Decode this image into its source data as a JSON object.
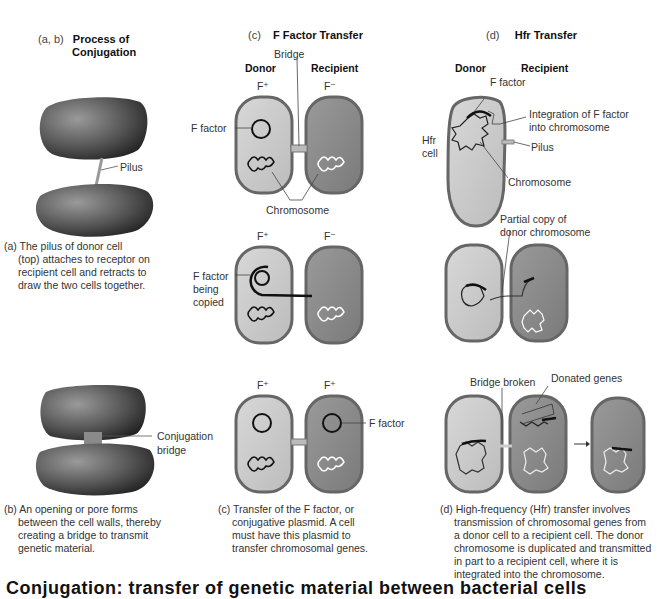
{
  "columns": {
    "ab": {
      "prefix": "(a, b)",
      "title_line1": "Process of",
      "title_line2": "Conjugation"
    },
    "c": {
      "prefix": "(c)",
      "title": "F Factor Transfer"
    },
    "d": {
      "prefix": "(d)",
      "title": "Hfr Transfer"
    }
  },
  "panel_a": {
    "pilus_label": "Pilus",
    "caption_lines": [
      "(a) The pilus of donor cell",
      "(top) attaches to receptor on",
      "recipient cell and retracts to",
      "draw the two cells together."
    ]
  },
  "panel_b": {
    "bridge_label_1": "Conjugation",
    "bridge_label_2": "bridge",
    "caption_lines": [
      "(b) An opening or pore forms",
      "between the cell walls, thereby",
      "creating a bridge to transmit",
      "genetic material."
    ]
  },
  "panel_c": {
    "bridge_label": "Bridge",
    "donor": "Donor",
    "recipient": "Recipient",
    "row1": {
      "donor_type": "F⁺",
      "recipient_type": "F⁻",
      "f_factor": "F factor",
      "chromosome": "Chromosome"
    },
    "row2": {
      "donor_type": "F⁺",
      "recipient_type": "F⁻",
      "f_factor_1": "F factor",
      "f_factor_2": "being",
      "f_factor_3": "copied"
    },
    "row3": {
      "donor_type": "F⁺",
      "recipient_type": "F⁺",
      "f_factor": "F factor"
    },
    "caption_lines": [
      "(c) Transfer of the F factor, or",
      "conjugative plasmid. A cell",
      "must have this plasmid to",
      "transfer chromosomal genes."
    ]
  },
  "panel_d": {
    "donor": "Donor",
    "recipient": "Recipient",
    "row1": {
      "f_factor": "F factor",
      "integration_1": "Integration of F factor",
      "integration_2": "into chromosome",
      "hfr_1": "Hfr",
      "hfr_2": "cell",
      "pilus": "Pilus",
      "chromosome": "Chromosome"
    },
    "row2": {
      "partial_1": "Partial copy of",
      "partial_2": "donor chromosome"
    },
    "row3": {
      "bridge_broken": "Bridge broken",
      "donated_genes": "Donated genes"
    },
    "caption_lines": [
      "(d) High-frequency (Hfr) transfer involves",
      "transmission of chromosomal genes from",
      "a donor cell to a recipient cell. The donor",
      "chromosome is duplicated and transmitted",
      "in part to a recipient cell, where it is",
      "integrated into the chromosome."
    ]
  },
  "bottom_text": "Conjugation: transfer of genetic material between bacterial cells"
}
